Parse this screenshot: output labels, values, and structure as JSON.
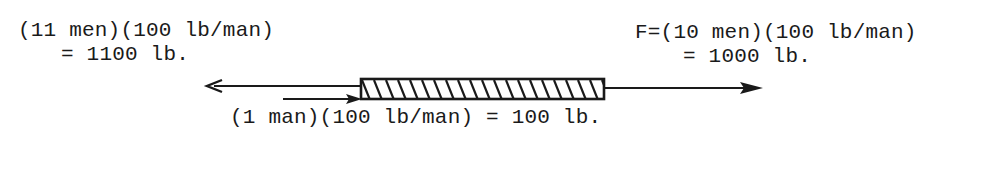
{
  "diagram": {
    "type": "force-diagram",
    "left_force": {
      "line1": "(11 men)(100 lb/man)",
      "line2": "= 1100 lb.",
      "direction": "left"
    },
    "right_force": {
      "line1": "F=(10 men)(100 lb/man)",
      "line2": "= 1000 lb.",
      "direction": "right"
    },
    "bottom_force": {
      "text": "(1 man)(100 lb/man) = 100 lb.",
      "direction": "right"
    },
    "object": {
      "shape": "hatched-bar"
    },
    "colors": {
      "ink": "#1a1a1a",
      "background": "#ffffff"
    }
  }
}
